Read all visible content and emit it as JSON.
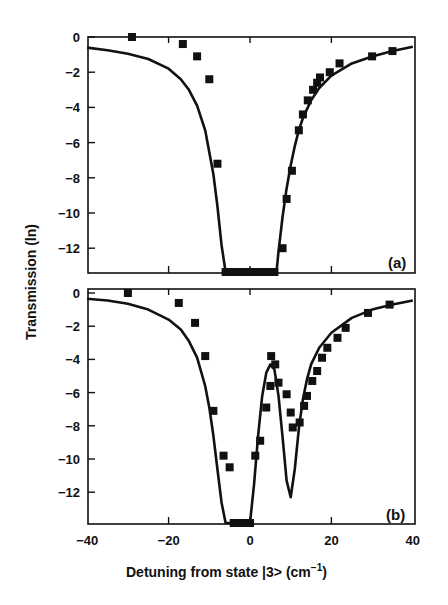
{
  "figure": {
    "ylabel": "Transmission (ln)",
    "xlabel_main": "Detuning from state |3> (cm",
    "xlabel_sup": "−1",
    "xlabel_close": ")",
    "panel_labels": [
      "(a)",
      "(b)"
    ],
    "x_ticks": [
      "−40",
      "−20",
      "0",
      "20",
      "40"
    ],
    "y_ticks": [
      "0",
      "−2",
      "−4",
      "−6",
      "−8",
      "−10",
      "−12"
    ]
  },
  "chart_data": [
    {
      "type": "scatter",
      "panel": "(a)",
      "title": "",
      "xlabel": "Detuning from state |3> (cm^-1)",
      "ylabel": "Transmission (ln)",
      "xlim": [
        -40,
        40
      ],
      "ylim": [
        -14,
        0
      ],
      "x_ticks": [
        -40,
        -20,
        0,
        20,
        40
      ],
      "y_ticks": [
        0,
        -2,
        -4,
        -6,
        -8,
        -10,
        -12
      ],
      "grid": false,
      "series": [
        {
          "name": "measured",
          "style": "square-markers",
          "x": [
            -29,
            -16.5,
            -13,
            -10,
            -8,
            -6,
            -5,
            -4,
            -3,
            -2,
            -1,
            0,
            1,
            2,
            3,
            4,
            5,
            6,
            8,
            9,
            10.3,
            12,
            13,
            14.2,
            15.5,
            16.5,
            17.2,
            19.6,
            22,
            30,
            35
          ],
          "y": [
            0,
            -0.4,
            -1.1,
            -2.4,
            -7.2,
            -13.8,
            -13.8,
            -13.8,
            -13.8,
            -13.8,
            -13.8,
            -13.8,
            -13.8,
            -13.8,
            -13.8,
            -13.8,
            -13.8,
            -13.8,
            -12,
            -9.2,
            -7.6,
            -5.3,
            -4.4,
            -3.6,
            -3.0,
            -2.6,
            -2.3,
            -2.0,
            -1.5,
            -1.1,
            -0.8
          ]
        },
        {
          "name": "calculated",
          "style": "solid-line",
          "x": [
            -40,
            -35,
            -30,
            -25,
            -20,
            -17,
            -15,
            -13,
            -11,
            -9,
            -8,
            -7,
            -6,
            -5,
            0,
            6.5,
            7,
            8,
            9,
            10,
            11,
            12,
            13,
            15,
            17,
            20,
            25,
            30,
            35,
            40
          ],
          "y": [
            -0.6,
            -0.75,
            -0.95,
            -1.25,
            -1.8,
            -2.4,
            -3.0,
            -3.9,
            -5.3,
            -7.8,
            -9.6,
            -11.8,
            -13.8,
            -13.8,
            -13.8,
            -13.8,
            -12.2,
            -10.2,
            -8.6,
            -7.3,
            -6.2,
            -5.3,
            -4.6,
            -3.6,
            -2.9,
            -2.2,
            -1.5,
            -1.1,
            -0.8,
            -0.55
          ]
        }
      ]
    },
    {
      "type": "scatter",
      "panel": "(b)",
      "title": "",
      "xlabel": "Detuning from state |3> (cm^-1)",
      "ylabel": "Transmission (ln)",
      "xlim": [
        -40,
        40
      ],
      "ylim": [
        -14,
        0
      ],
      "x_ticks": [
        -40,
        -20,
        0,
        20,
        40
      ],
      "y_ticks": [
        0,
        -2,
        -4,
        -6,
        -8,
        -10,
        -12
      ],
      "grid": false,
      "series": [
        {
          "name": "measured",
          "style": "square-markers",
          "x": [
            -30,
            -17.5,
            -13.5,
            -11,
            -9,
            -6.5,
            -5,
            -4,
            -3,
            -2,
            -1,
            0,
            1.3,
            2.5,
            4,
            5,
            5.2,
            6.2,
            7,
            9,
            10,
            10.5,
            12.2,
            13.3,
            14,
            15.3,
            16.5,
            17.7,
            19,
            21.5,
            23.5,
            29,
            34.3
          ],
          "y": [
            0,
            -0.6,
            -1.8,
            -3.8,
            -7.1,
            -9.8,
            -10.5,
            -13.9,
            -13.9,
            -13.9,
            -13.9,
            -13.9,
            -9.8,
            -8.9,
            -6.9,
            -5.6,
            -3.8,
            -4.3,
            -5.4,
            -6.1,
            -7.2,
            -8.1,
            -7.8,
            -6.8,
            -6.2,
            -5.3,
            -4.7,
            -3.9,
            -3.3,
            -2.7,
            -2.1,
            -1.2,
            -0.7
          ]
        },
        {
          "name": "calculated",
          "style": "solid-line",
          "x": [
            -40,
            -35,
            -30,
            -25,
            -20,
            -17,
            -15,
            -13,
            -11,
            -10,
            -9,
            -8,
            -7,
            -6,
            -5.5,
            0,
            1,
            2,
            3,
            4,
            5,
            6,
            7,
            8,
            9,
            10,
            11,
            12,
            13,
            14,
            15,
            17,
            20,
            25,
            30,
            35,
            40
          ],
          "y": [
            -0.35,
            -0.45,
            -0.65,
            -1.0,
            -1.6,
            -2.2,
            -2.9,
            -3.9,
            -5.6,
            -6.9,
            -8.6,
            -10.6,
            -12.6,
            -13.9,
            -13.9,
            -13.9,
            -11.5,
            -8.6,
            -6.2,
            -4.8,
            -4.3,
            -4.6,
            -6.2,
            -8.7,
            -11.3,
            -12.3,
            -10.6,
            -8.2,
            -6.4,
            -5.2,
            -4.3,
            -3.3,
            -2.4,
            -1.5,
            -1.0,
            -0.7,
            -0.45
          ]
        }
      ]
    }
  ]
}
